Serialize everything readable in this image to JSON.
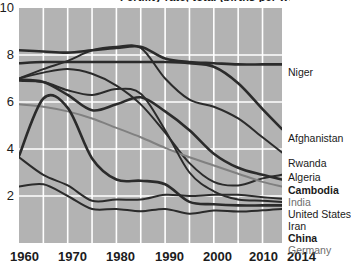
{
  "chart_data": {
    "type": "line",
    "title": "Fertility rate, total (births per woman)",
    "xlabel": "",
    "ylabel": "",
    "xlim": [
      1960,
      2014
    ],
    "ylim": [
      0,
      10
    ],
    "yticks": [
      2,
      4,
      6,
      8,
      10
    ],
    "xticks": [
      1960,
      1970,
      1980,
      1990,
      2000,
      2010,
      2014
    ],
    "grid": true,
    "grid_color": "#ffffff",
    "plot_background": "#b3b3b3",
    "legend_position": "right-end-of-line",
    "x": [
      1960,
      1965,
      1970,
      1975,
      1980,
      1985,
      1990,
      1995,
      2000,
      2005,
      2010,
      2014
    ],
    "series": [
      {
        "name": "Niger",
        "color": "#2b2b2b",
        "weight": "bold",
        "values": [
          8.2,
          8.15,
          8.1,
          8.2,
          8.3,
          8.35,
          7.85,
          7.7,
          7.65,
          7.6,
          7.6,
          7.6
        ]
      },
      {
        "name": "Afghanistan",
        "color": "#2b2b2b",
        "weight": "bold",
        "values": [
          7.65,
          7.7,
          7.7,
          7.7,
          7.7,
          7.7,
          7.7,
          7.65,
          7.5,
          6.8,
          5.7,
          4.85
        ]
      },
      {
        "name": "Rwanda",
        "color": "#2b2b2b",
        "weight": "normal",
        "values": [
          7.0,
          7.4,
          7.75,
          8.2,
          8.35,
          8.3,
          7.0,
          6.1,
          5.8,
          5.3,
          4.5,
          3.85
        ]
      },
      {
        "name": "Algeria",
        "color": "#2b2b2b",
        "weight": "normal",
        "values": [
          7.0,
          7.25,
          7.4,
          7.2,
          6.7,
          5.9,
          4.7,
          3.4,
          2.6,
          2.45,
          2.75,
          2.9
        ]
      },
      {
        "name": "Cambodia",
        "color": "#2b2b2b",
        "weight": "bold",
        "values": [
          6.95,
          6.85,
          6.3,
          5.65,
          5.9,
          6.2,
          5.6,
          4.8,
          3.8,
          3.2,
          2.9,
          2.7
        ]
      },
      {
        "name": "India",
        "color": "#808080",
        "weight": "normal",
        "values": [
          5.9,
          5.8,
          5.6,
          5.3,
          4.9,
          4.5,
          4.05,
          3.65,
          3.3,
          2.95,
          2.6,
          2.4
        ]
      },
      {
        "name": "United States",
        "color": "#2b2b2b",
        "weight": "normal",
        "values": [
          3.65,
          2.9,
          2.45,
          1.8,
          1.85,
          1.85,
          2.05,
          2.0,
          2.05,
          2.05,
          1.95,
          1.88
        ]
      },
      {
        "name": "Iran",
        "color": "#2b2b2b",
        "weight": "normal",
        "values": [
          6.9,
          6.85,
          6.5,
          6.3,
          6.55,
          6.35,
          4.8,
          3.0,
          2.2,
          1.85,
          1.8,
          1.75
        ]
      },
      {
        "name": "China",
        "color": "#2b2b2b",
        "weight": "bold",
        "values": [
          3.7,
          6.15,
          5.75,
          3.6,
          2.7,
          2.65,
          2.5,
          1.75,
          1.65,
          1.6,
          1.6,
          1.6
        ]
      },
      {
        "name": "Germany",
        "color": "#2b2b2b",
        "weight": "normal",
        "values": [
          2.4,
          2.5,
          2.0,
          1.45,
          1.45,
          1.35,
          1.45,
          1.25,
          1.38,
          1.34,
          1.39,
          1.45
        ]
      }
    ],
    "legend_entries": [
      {
        "label": "Niger",
        "y": 67,
        "style": "normal"
      },
      {
        "label": "Afghanistan",
        "y": 133,
        "style": "normal"
      },
      {
        "label": "Rwanda",
        "y": 158,
        "style": "normal"
      },
      {
        "label": "Algeria",
        "y": 172,
        "style": "normal"
      },
      {
        "label": "Cambodia",
        "y": 185,
        "style": "bold"
      },
      {
        "label": "India",
        "y": 197,
        "style": "grey"
      },
      {
        "label": "United States",
        "y": 209,
        "style": "normal"
      },
      {
        "label": "Iran",
        "y": 221,
        "style": "normal"
      },
      {
        "label": "China",
        "y": 233,
        "style": "bold"
      },
      {
        "label": "Germany",
        "y": 245,
        "style": "grey"
      }
    ]
  }
}
